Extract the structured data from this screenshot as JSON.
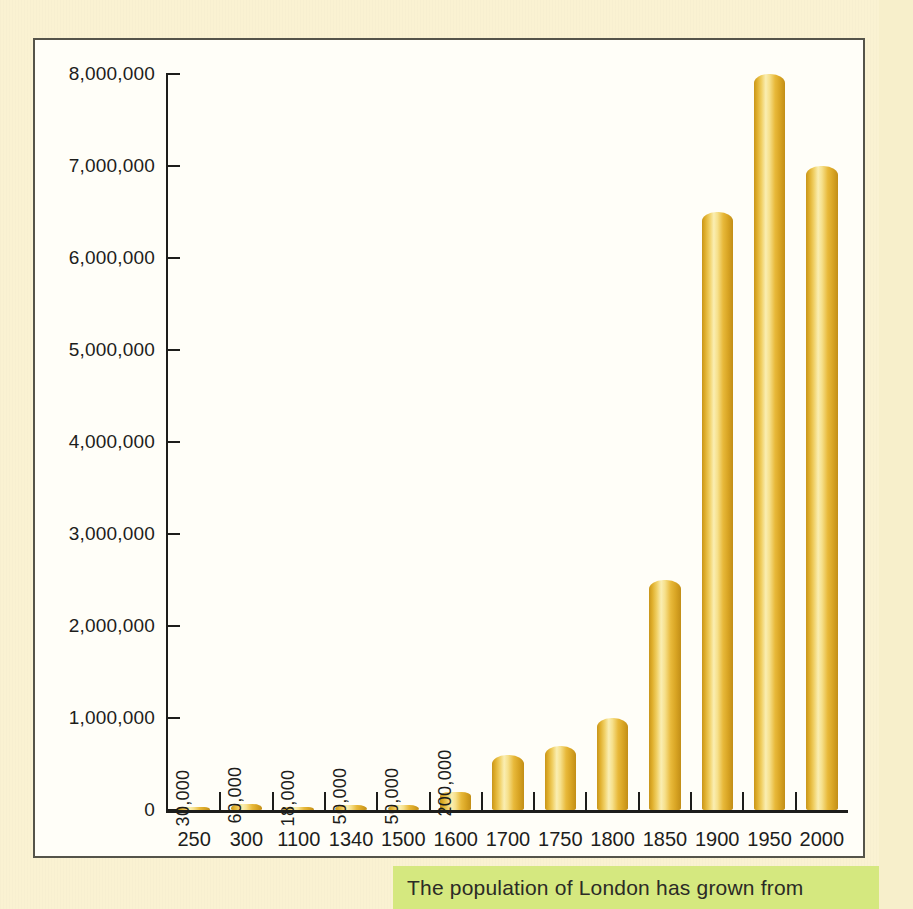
{
  "caption": {
    "text": "The population of London has grown from"
  },
  "colors": {
    "page_background": "#faf2d2",
    "panel_background": "#fffef8",
    "panel_border": "#55544a",
    "bar_gold_dark": "#c28e17",
    "bar_gold_mid": "#e8b93a",
    "bar_gold_light": "#faeeb2",
    "axis": "#1d1d1b",
    "caption_band": "#d5e87f",
    "caption_text": "#2b2b26"
  },
  "chart_data": {
    "type": "bar",
    "title": "",
    "xlabel": "",
    "ylabel": "",
    "grid": false,
    "legend": "none",
    "ylim": [
      0,
      8000000
    ],
    "yticks": [
      0,
      1000000,
      2000000,
      3000000,
      4000000,
      5000000,
      6000000,
      7000000,
      8000000
    ],
    "ytick_labels": [
      "0",
      "1,000,000",
      "2,000,000",
      "3,000,000",
      "4,000,000",
      "5,000,000",
      "6,000,000",
      "7,000,000",
      "8,000,000"
    ],
    "categories": [
      "250",
      "300",
      "1100",
      "1340",
      "1500",
      "1600",
      "1700",
      "1750",
      "1800",
      "1850",
      "1900",
      "1950",
      "2000"
    ],
    "values": [
      30000,
      60000,
      18000,
      50000,
      50000,
      200000,
      600000,
      700000,
      1000000,
      2500000,
      6500000,
      8000000,
      7000000
    ],
    "point_labels": [
      "30,000",
      "60,000",
      "18,000",
      "50,000",
      "50,000",
      "200,000",
      "",
      "",
      "",
      "",
      "",
      "",
      ""
    ]
  }
}
